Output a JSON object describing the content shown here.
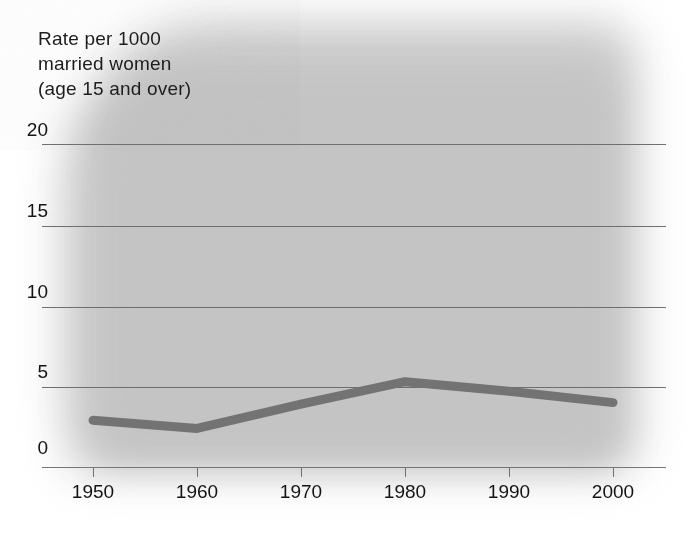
{
  "chart_data": {
    "type": "line",
    "title": "Rate per 1000 married women (age 15 and over)",
    "title_lines": [
      "Rate per 1000",
      "married women",
      "(age 15 and over)"
    ],
    "xlabel": "",
    "ylabel": "Rate per 1000 married women (age 15 and over)",
    "x": [
      1950,
      1960,
      1970,
      1980,
      1990,
      2000
    ],
    "categories": [
      "1950",
      "1960",
      "1970",
      "1980",
      "1990",
      "2000"
    ],
    "values": [
      2.9,
      2.4,
      3.9,
      5.3,
      4.7,
      4.0
    ],
    "series": [
      {
        "name": "Divorce rate",
        "values": [
          2.9,
          2.4,
          3.9,
          5.3,
          4.7,
          4.0
        ],
        "color": "#737373"
      }
    ],
    "ylim": [
      0,
      21
    ],
    "xlim": [
      1950,
      2000
    ],
    "yticks": [
      0,
      5,
      10,
      15,
      20
    ],
    "ytick_labels": [
      "0",
      "5",
      "10",
      "15",
      "20"
    ],
    "xticks": [
      1950,
      1960,
      1970,
      1980,
      1990,
      2000
    ],
    "xtick_labels": [
      "1950",
      "1960",
      "1970",
      "1980",
      "1990",
      "2000"
    ],
    "grid": true,
    "grid_color": "#6f6f6f",
    "legend": false,
    "legend_position": "none",
    "background_color": "#c8c8c8",
    "plot_face_color": "#c8c8c8",
    "line_color": "#737373",
    "line_width": 9,
    "text_color": "#141414"
  }
}
